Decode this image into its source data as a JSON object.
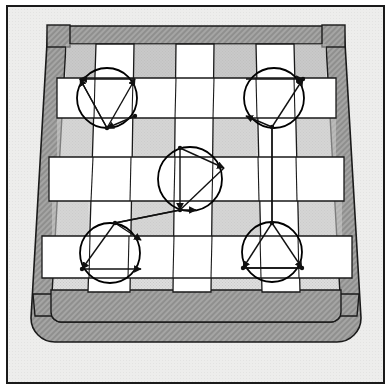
{
  "figure": {
    "caption": "",
    "width": 391,
    "height": 389
  },
  "colors": {
    "page_background": "#ffffff",
    "outer_panel": "#ececeb",
    "panel_border": "#1a1a1a",
    "frame_dark_gray": "#9d9d9d",
    "weave_shadow_gray": "#d6d6d4",
    "strip_white": "#ffffff",
    "line_black": "#111111",
    "marker_stroke": "#000000"
  },
  "panel": {
    "name": "outer-panel",
    "x": 6,
    "y": 5,
    "width": 379,
    "height": 379,
    "border_width": 2
  },
  "basket_frame": {
    "name": "trapezoid-frame",
    "description": "Tapered outer rim, darker gray, rounded at the bottom corners with small square tabs at the top corners",
    "top_left": [
      48,
      26
    ],
    "top_right": [
      344,
      26
    ],
    "bottom_left": [
      31,
      342
    ],
    "bottom_right": [
      361,
      342
    ],
    "rim_thickness": 18,
    "bottom_corner_radius": 24,
    "tab_width": 22,
    "tab_height": 22
  },
  "weave": {
    "description": "Three horizontal white strips interlaced over/under three vertical white strips on a light gray ground",
    "vertical_strips": [
      {
        "name": "vertical-strip-left",
        "top_x": 96,
        "bottom_x": 88,
        "width": 38
      },
      {
        "name": "vertical-strip-center",
        "top_x": 176,
        "bottom_x": 173,
        "width": 38
      },
      {
        "name": "vertical-strip-right",
        "top_x": 256,
        "bottom_x": 262,
        "width": 38
      }
    ],
    "horizontal_strips": [
      {
        "name": "horizontal-strip-top",
        "y": 78,
        "height": 40,
        "left_x": 57,
        "right_x": 336
      },
      {
        "name": "horizontal-strip-middle",
        "y": 157,
        "height": 44,
        "left_x": 49,
        "right_x": 344
      },
      {
        "name": "horizontal-strip-bottom",
        "y": 236,
        "height": 42,
        "left_x": 42,
        "right_x": 352
      }
    ]
  },
  "markers": [
    {
      "id": "marker-top-left",
      "label": "top-left joint marker",
      "cx": 107,
      "cy": 98,
      "r": 30,
      "vectors": [
        {
          "from": [
            107,
            128
          ],
          "to": [
            80,
            79
          ],
          "arrow": "end"
        },
        {
          "from": [
            107,
            128
          ],
          "to": [
            135,
            79
          ],
          "arrow": "end"
        },
        {
          "from": [
            135,
            79
          ],
          "to": [
            80,
            79
          ],
          "arrow": "end"
        },
        {
          "from": [
            80,
            79
          ],
          "to": [
            107,
            128
          ],
          "arrow": "none"
        },
        {
          "from": [
            135,
            116
          ],
          "to": [
            107,
            128
          ],
          "arrow": "end"
        }
      ]
    },
    {
      "id": "marker-top-right",
      "label": "top-right joint marker",
      "cx": 274,
      "cy": 98,
      "r": 30,
      "vectors": [
        {
          "from": [
            246,
            79
          ],
          "to": [
            303,
            79
          ],
          "arrow": "end"
        },
        {
          "from": [
            272,
            127
          ],
          "to": [
            303,
            79
          ],
          "arrow": "end"
        },
        {
          "from": [
            272,
            127
          ],
          "to": [
            246,
            116
          ],
          "arrow": "end"
        },
        {
          "from": [
            272,
            127
          ],
          "to": [
            272,
            223
          ],
          "arrow": "none"
        }
      ]
    },
    {
      "id": "marker-center",
      "label": "center joint marker",
      "cx": 190,
      "cy": 179,
      "r": 32,
      "vectors": [
        {
          "from": [
            180,
            148
          ],
          "to": [
            224,
            168
          ],
          "arrow": "end"
        },
        {
          "from": [
            180,
            148
          ],
          "to": [
            180,
            210
          ],
          "arrow": "end"
        },
        {
          "from": [
            180,
            210
          ],
          "to": [
            196,
            210
          ],
          "arrow": "end"
        },
        {
          "from": [
            224,
            168
          ],
          "to": [
            180,
            210
          ],
          "arrow": "none"
        }
      ]
    },
    {
      "id": "marker-bottom-left",
      "label": "bottom-left joint marker",
      "cx": 110,
      "cy": 253,
      "r": 30,
      "vectors": [
        {
          "from": [
            115,
            223
          ],
          "to": [
            82,
            269
          ],
          "arrow": "end"
        },
        {
          "from": [
            82,
            269
          ],
          "to": [
            141,
            269
          ],
          "arrow": "end"
        },
        {
          "from": [
            115,
            223
          ],
          "to": [
            141,
            240
          ],
          "arrow": "end"
        },
        {
          "from": [
            180,
            210
          ],
          "to": [
            115,
            223
          ],
          "arrow": "none"
        }
      ]
    },
    {
      "id": "marker-bottom-right",
      "label": "bottom-right joint marker",
      "cx": 272,
      "cy": 252,
      "r": 30,
      "vectors": [
        {
          "from": [
            272,
            223
          ],
          "to": [
            243,
            268
          ],
          "arrow": "end"
        },
        {
          "from": [
            272,
            223
          ],
          "to": [
            302,
            268
          ],
          "arrow": "end"
        },
        {
          "from": [
            243,
            268
          ],
          "to": [
            302,
            268
          ],
          "arrow": "none"
        },
        {
          "from": [
            302,
            268
          ],
          "to": [
            243,
            268
          ],
          "arrow": "none"
        }
      ]
    }
  ],
  "connectors": [
    {
      "name": "connector-center-to-bottom-left",
      "from": [
        180,
        210
      ],
      "to": [
        115,
        223
      ]
    },
    {
      "name": "connector-top-right-vertical",
      "from": [
        272,
        127
      ],
      "to": [
        272,
        223
      ]
    }
  ]
}
